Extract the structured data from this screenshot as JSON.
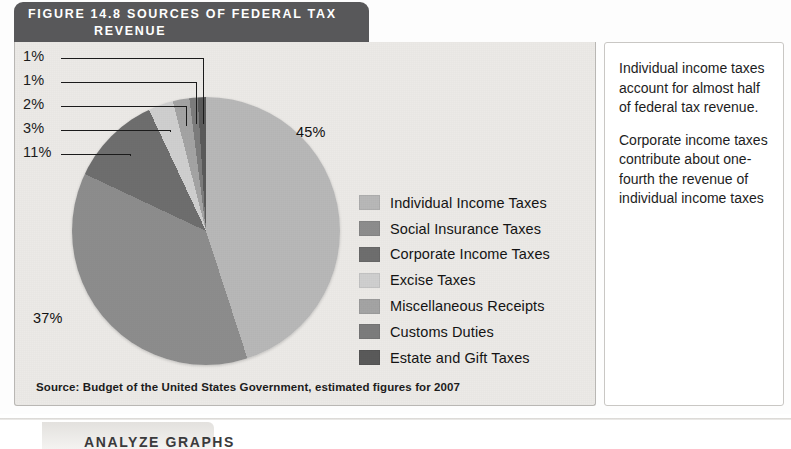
{
  "figure": {
    "header_line1": "FIGURE 14.8   SOURCES OF FEDERAL TAX",
    "header_line2": "REVENUE",
    "source_note": "Source: Budget of the United States Government, estimated figures for 2007"
  },
  "notes": {
    "paragraph1": "Individual income taxes account for almost half of federal tax revenue.",
    "paragraph2": "Corporate income taxes contribute about one-fourth the revenue of individual income taxes"
  },
  "bottom": {
    "heading": "ANALYZE GRAPHS"
  },
  "colors": {
    "header_bg": "#58585a",
    "panel_bg": "#eceae7",
    "panel_border": "#b9b7b4",
    "note_bg": "#ffffff",
    "text": "#1b1b1b"
  },
  "chart_data": {
    "type": "pie",
    "title": "FIGURE 14.8   SOURCES OF FEDERAL TAX REVENUE",
    "source": "Source: Budget of the United States Government, estimated figures for 2007",
    "legend_position": "right",
    "start_angle_clock": 12,
    "direction": "clockwise",
    "unit": "percent",
    "categories": [
      "Individual Income Taxes",
      "Social Insurance Taxes",
      "Corporate Income Taxes",
      "Excise Taxes",
      "Miscellaneous Receipts",
      "Customs Duties",
      "Estate and Gift Taxes"
    ],
    "values": [
      45,
      37,
      11,
      3,
      2,
      1,
      1
    ],
    "labels": [
      "45%",
      "37%",
      "11%",
      "3%",
      "2%",
      "1%",
      "1%"
    ],
    "slice_colors": [
      "#b8b8b8",
      "#8d8d8d",
      "#6e6e6e",
      "#cfcfcf",
      "#a4a4a4",
      "#7c7c7c",
      "#5a5a5a"
    ],
    "slices": [
      {
        "label": "Individual Income Taxes",
        "value": 45,
        "display": "45%",
        "color": "#b8b8b8",
        "callout": "inline"
      },
      {
        "label": "Social Insurance Taxes",
        "value": 37,
        "display": "37%",
        "color": "#8d8d8d",
        "callout": "inline"
      },
      {
        "label": "Corporate Income Taxes",
        "value": 11,
        "display": "11%",
        "color": "#6e6e6e",
        "callout": "leader"
      },
      {
        "label": "Excise Taxes",
        "value": 3,
        "display": "3%",
        "color": "#cfcfcf",
        "callout": "leader"
      },
      {
        "label": "Miscellaneous Receipts",
        "value": 2,
        "display": "2%",
        "color": "#a4a4a4",
        "callout": "leader"
      },
      {
        "label": "Customs Duties",
        "value": 1,
        "display": "1%",
        "color": "#7c7c7c",
        "callout": "leader"
      },
      {
        "label": "Estate and Gift Taxes",
        "value": 1,
        "display": "1%",
        "color": "#5a5a5a",
        "callout": "leader"
      }
    ]
  }
}
